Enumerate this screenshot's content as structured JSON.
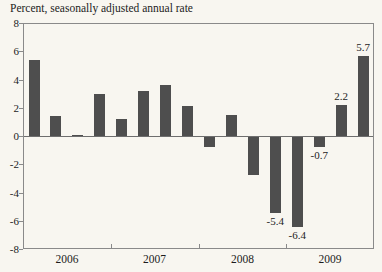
{
  "colors": {
    "background": "#f8f6f0",
    "bar": "#4e4e4e",
    "axis": "#8a8a8a",
    "zero_line": "#6e6e6e",
    "text": "#1c1c1c"
  },
  "chart_data": {
    "type": "bar",
    "title": "Percent, seasonally adjusted annual rate",
    "categories": [
      "2006 Q1",
      "2006 Q2",
      "2006 Q3",
      "2006 Q4",
      "2007 Q1",
      "2007 Q2",
      "2007 Q3",
      "2007 Q4",
      "2008 Q1",
      "2008 Q2",
      "2008 Q3",
      "2008 Q4",
      "2009 Q1",
      "2009 Q2",
      "2009 Q3",
      "2009 Q4"
    ],
    "values": [
      5.4,
      1.4,
      0.1,
      3.0,
      1.2,
      3.2,
      3.6,
      2.1,
      -0.7,
      1.5,
      -2.7,
      -5.4,
      -6.4,
      -0.7,
      2.2,
      5.7
    ],
    "ylabel": "",
    "xlabel": "",
    "ylim": [
      -8,
      8
    ],
    "y_ticks": [
      8,
      6,
      4,
      2,
      0,
      -2,
      -4,
      -6,
      -8
    ],
    "year_labels": [
      "2006",
      "2007",
      "2008",
      "2009"
    ],
    "grid": false,
    "legend": false,
    "annotations": [
      {
        "category": "2008 Q4",
        "text": "-5.4",
        "placement": "below"
      },
      {
        "category": "2009 Q1",
        "text": "-6.4",
        "placement": "below"
      },
      {
        "category": "2009 Q2",
        "text": "-0.7",
        "placement": "below"
      },
      {
        "category": "2009 Q3",
        "text": "2.2",
        "placement": "above"
      },
      {
        "category": "2009 Q4",
        "text": "5.7",
        "placement": "above"
      }
    ]
  }
}
